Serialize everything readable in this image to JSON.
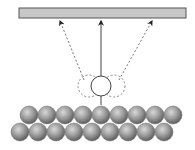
{
  "diagram": {
    "colors": {
      "background": "#ffffff",
      "plate_fill": "#c8c8c8",
      "plate_stroke": "#555555",
      "line": "#444444",
      "dashed": "#777777",
      "sphere_light": "#d8d8d8",
      "sphere_mid": "#9a9a9a",
      "sphere_dark": "#5e5e5e"
    },
    "plate": {
      "x": 19,
      "y": 8,
      "width": 167,
      "height": 10
    },
    "arrows": [
      {
        "name": "left-dashed-arrow",
        "x1": 84,
        "y1": 80,
        "x2": 60,
        "y2": 21,
        "style": "dashed"
      },
      {
        "name": "center-solid-arrow",
        "x1": 101,
        "y1": 76,
        "x2": 101,
        "y2": 21,
        "style": "solid"
      },
      {
        "name": "right-dashed-arrow",
        "x1": 119,
        "y1": 80,
        "x2": 152,
        "y2": 21,
        "style": "dashed"
      }
    ],
    "molecule": {
      "cx": 101,
      "cy": 86,
      "r": 10
    },
    "ghost_positions": [
      {
        "cx": 89,
        "cy": 86,
        "r": 11
      },
      {
        "cx": 114,
        "cy": 86,
        "r": 11
      }
    ],
    "stem": {
      "x": 101,
      "y1": 96,
      "y2": 105
    },
    "surface": {
      "radius": 9,
      "top_row": {
        "cy": 115,
        "cx": [
          29,
          47,
          65,
          83,
          101,
          119,
          137,
          155,
          173
        ]
      },
      "bottom_row": {
        "cy": 132,
        "cx": [
          20,
          38,
          56,
          74,
          92,
          110,
          128,
          146,
          164
        ]
      }
    }
  }
}
